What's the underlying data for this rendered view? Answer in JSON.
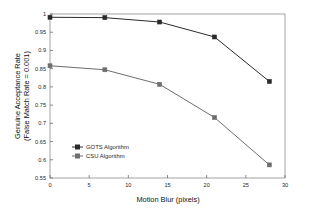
{
  "chart_data": {
    "type": "line",
    "title": "",
    "xlabel": "Motion Blur (pixels)",
    "ylabel": "Genuine Acceptance Rate\n(False Match Rate = 0.001)",
    "ylabel_line1": "Genuine Acceptance Rate",
    "ylabel_line2": "(False Match Rate = 0.001)",
    "x": [
      0,
      7,
      14,
      21,
      28
    ],
    "xlim": [
      0,
      30
    ],
    "ylim": [
      0.55,
      1.0
    ],
    "xticks": [
      0,
      5,
      10,
      15,
      20,
      25,
      30
    ],
    "xticklabels": [
      "0",
      "5",
      "10",
      "15",
      "20",
      "25",
      "30"
    ],
    "yticks": [
      0.55,
      0.6,
      0.65,
      0.7,
      0.75,
      0.8,
      0.85,
      0.9,
      0.95,
      1.0
    ],
    "yticklabels": [
      "0.55",
      "0.6",
      "0.65",
      "0.7",
      "0.75",
      "0.8",
      "0.85",
      "0.9",
      "0.95",
      "1"
    ],
    "grid": false,
    "legend_position": "center-left",
    "series": [
      {
        "name": "GOTS Algorithm",
        "color": "#2b2b2b",
        "marker": "square",
        "values": [
          0.991,
          0.99,
          0.978,
          0.937,
          0.815
        ]
      },
      {
        "name": "CSU Algorithm",
        "color": "#6e6e6e",
        "marker": "square",
        "values": [
          0.858,
          0.847,
          0.807,
          0.716,
          0.586
        ]
      }
    ]
  },
  "legend": {
    "items": [
      {
        "label": "GOTS Algorithm"
      },
      {
        "label": "CSU Algorithm"
      }
    ]
  },
  "colors": {
    "background": "#ffffff",
    "frame": "#8c8c8c",
    "series_gots": "#2b2b2b",
    "series_csu": "#6e6e6e"
  }
}
